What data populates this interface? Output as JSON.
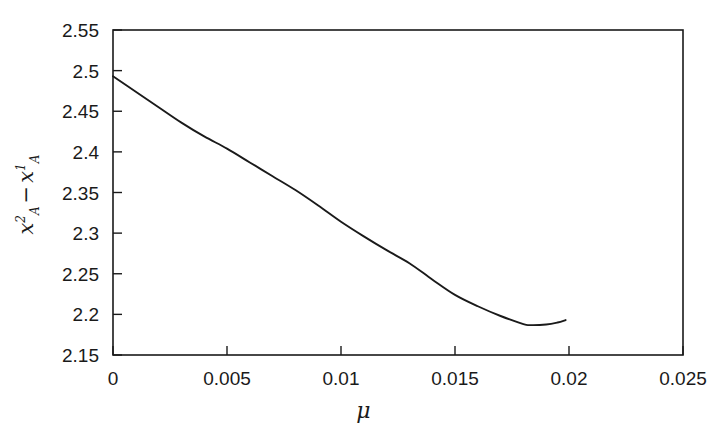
{
  "chart_data": {
    "type": "line",
    "title": "",
    "xlabel": "μ",
    "ylabel": "x_A^2 - x_A^1",
    "ylabel_parts": {
      "var1": "x",
      "sup1": "2",
      "sub1": "A",
      "operator": "−",
      "var2": "x",
      "sup2": "1",
      "sub2": "A"
    },
    "xlim": [
      0,
      0.025
    ],
    "ylim": [
      2.15,
      2.55
    ],
    "xticks": [
      0,
      0.005,
      0.01,
      0.015,
      0.02,
      0.025
    ],
    "xticklabels": [
      "0",
      "0.005",
      "0.01",
      "0.015",
      "0.02",
      "0.025"
    ],
    "yticks": [
      2.15,
      2.2,
      2.25,
      2.3,
      2.35,
      2.4,
      2.45,
      2.5,
      2.55
    ],
    "yticklabels": [
      "2.15",
      "2.2",
      "2.25",
      "2.3",
      "2.35",
      "2.4",
      "2.45",
      "2.5",
      "2.55"
    ],
    "grid": false,
    "legend": null,
    "frame": "box",
    "line_color": "#1a1a1a",
    "background_color": "#ffffff",
    "series": [
      {
        "name": "x_A^2 - x_A^1",
        "x": [
          0.0,
          0.001,
          0.002,
          0.003,
          0.004,
          0.005,
          0.006,
          0.007,
          0.008,
          0.009,
          0.01,
          0.011,
          0.012,
          0.013,
          0.014,
          0.015,
          0.016,
          0.017,
          0.018,
          0.0183,
          0.019,
          0.0195,
          0.01985
        ],
        "y": [
          2.493,
          2.474,
          2.455,
          2.436,
          2.419,
          2.404,
          2.387,
          2.37,
          2.353,
          2.334,
          2.314,
          2.296,
          2.279,
          2.263,
          2.243,
          2.224,
          2.21,
          2.198,
          2.188,
          2.1868,
          2.1875,
          2.19,
          2.193
        ]
      }
    ],
    "annotations": {
      "start_point": {
        "x": 0.0,
        "y": 2.493
      },
      "minimum_point": {
        "x": 0.0183,
        "y": 2.187
      },
      "end_point": {
        "x": 0.01985,
        "y": 2.193
      }
    }
  },
  "axes_geometry": {
    "plot_left_px": 113,
    "plot_right_px": 683,
    "plot_top_px": 30,
    "plot_bottom_px": 355
  }
}
